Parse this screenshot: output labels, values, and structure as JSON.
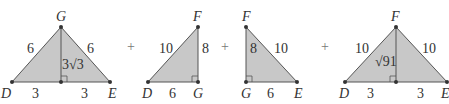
{
  "diagram": {
    "operator": "+",
    "triangles": [
      {
        "id": "triangle-DGE",
        "vertices": {
          "left": "D",
          "apex": "G",
          "right": "E"
        },
        "sides": {
          "left": "6",
          "right": "6",
          "altitude": "3√3",
          "base_left": "3",
          "base_right": "3"
        }
      },
      {
        "id": "triangle-DGF",
        "vertices": {
          "left": "D",
          "corner": "G",
          "top": "F"
        },
        "sides": {
          "hypotenuse": "10",
          "vertical": "8",
          "base": "6"
        }
      },
      {
        "id": "triangle-FGE",
        "vertices": {
          "top": "F",
          "corner": "G",
          "right": "E"
        },
        "sides": {
          "vertical": "8",
          "hypotenuse": "10",
          "base": "6"
        }
      },
      {
        "id": "triangle-DFE",
        "vertices": {
          "left": "D",
          "apex": "F",
          "right": "E"
        },
        "sides": {
          "left": "10",
          "right": "10",
          "altitude": "√91",
          "base_left": "3",
          "base_right": "3"
        }
      }
    ],
    "colors": {
      "fill": "#c8c8c8",
      "stroke": "#555555",
      "text": "#333333"
    }
  }
}
